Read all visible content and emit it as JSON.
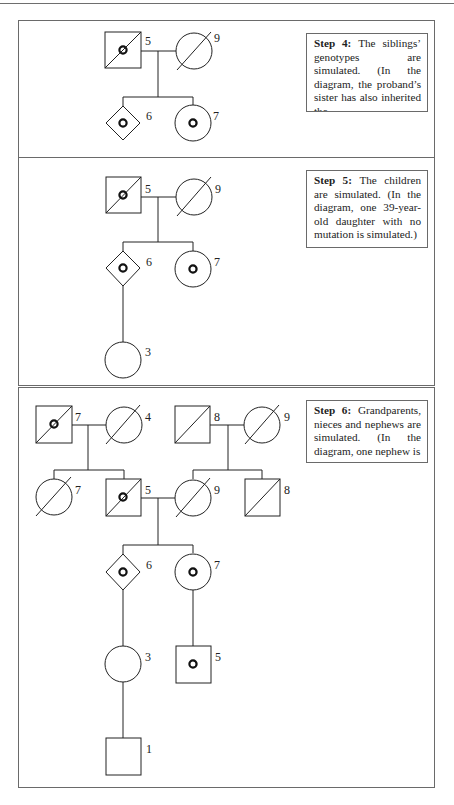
{
  "figure": {
    "panels": [
      {
        "id": "step4",
        "step_title": "Step 4:",
        "step_text": "The siblings’ genotypes are simulated. (In the diagram, the proband’s sister has also inherited the",
        "individuals": [
          {
            "id": "p1-father",
            "sex": "male",
            "label": "5",
            "deceased": true,
            "carrier": true
          },
          {
            "id": "p1-mother",
            "sex": "female",
            "label": "9",
            "deceased": true,
            "carrier": false
          },
          {
            "id": "p1-proband",
            "sex": "unknown",
            "label": "6",
            "deceased": false,
            "carrier": true
          },
          {
            "id": "p1-sister",
            "sex": "female",
            "label": "7",
            "deceased": false,
            "carrier": true
          }
        ]
      },
      {
        "id": "step5",
        "step_title": "Step 5:",
        "step_text": "The children are simulated. (In the diagram, one 39-year-old daughter with no mutation is simulated.)",
        "individuals": [
          {
            "id": "p2-father",
            "sex": "male",
            "label": "5",
            "deceased": true,
            "carrier": true
          },
          {
            "id": "p2-mother",
            "sex": "female",
            "label": "9",
            "deceased": true,
            "carrier": false
          },
          {
            "id": "p2-proband",
            "sex": "unknown",
            "label": "6",
            "deceased": false,
            "carrier": true
          },
          {
            "id": "p2-sister",
            "sex": "female",
            "label": "7",
            "deceased": false,
            "carrier": true
          },
          {
            "id": "p2-daughter",
            "sex": "female",
            "label": "3",
            "deceased": false,
            "carrier": false
          }
        ]
      },
      {
        "id": "step6",
        "step_title": "Step 6:",
        "step_text": "Grandparents, nieces and nephews are simulated. (In the diagram, one nephew is",
        "individuals": [
          {
            "id": "p3-pgf",
            "sex": "male",
            "label": "7",
            "deceased": true,
            "carrier": true
          },
          {
            "id": "p3-pgm",
            "sex": "female",
            "label": "4",
            "deceased": true,
            "carrier": false
          },
          {
            "id": "p3-mgf",
            "sex": "male",
            "label": "8",
            "deceased": true,
            "carrier": false
          },
          {
            "id": "p3-mgm",
            "sex": "female",
            "label": "9",
            "deceased": true,
            "carrier": false
          },
          {
            "id": "p3-aunt",
            "sex": "female",
            "label": "7",
            "deceased": true,
            "carrier": false
          },
          {
            "id": "p3-father",
            "sex": "male",
            "label": "5",
            "deceased": true,
            "carrier": true
          },
          {
            "id": "p3-mother",
            "sex": "female",
            "label": "9",
            "deceased": true,
            "carrier": false
          },
          {
            "id": "p3-uncle",
            "sex": "male",
            "label": "8",
            "deceased": true,
            "carrier": false
          },
          {
            "id": "p3-proband",
            "sex": "unknown",
            "label": "6",
            "deceased": false,
            "carrier": true
          },
          {
            "id": "p3-sister",
            "sex": "female",
            "label": "7",
            "deceased": false,
            "carrier": true
          },
          {
            "id": "p3-daughter",
            "sex": "female",
            "label": "3",
            "deceased": false,
            "carrier": false
          },
          {
            "id": "p3-nephew",
            "sex": "male",
            "label": "5",
            "deceased": false,
            "carrier": true
          },
          {
            "id": "p3-grandson",
            "sex": "male",
            "label": "1",
            "deceased": false,
            "carrier": false
          }
        ]
      }
    ],
    "colors": {
      "line": "#222222",
      "border": "#6a6a6a",
      "background": "#ffffff"
    }
  }
}
